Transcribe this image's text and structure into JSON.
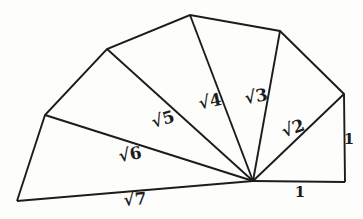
{
  "figure": {
    "name": "spiral-of-theodorus",
    "background_color": "#fdfdfb",
    "line_color": "#1c1c1c",
    "line_width": 1.9,
    "center_vertex": [
      253,
      181
    ],
    "outer_vertices": [
      [
        345,
        182
      ],
      [
        344,
        94
      ],
      [
        280,
        31
      ],
      [
        190,
        15
      ],
      [
        107,
        49
      ],
      [
        45,
        115
      ],
      [
        17,
        201
      ]
    ],
    "labels": [
      {
        "name": "hypotenuse-sqrt2-label",
        "text": "√2",
        "x": 293,
        "y": 128,
        "rotate": -20,
        "size": 17
      },
      {
        "name": "hypotenuse-sqrt3-label",
        "text": "√3",
        "x": 256,
        "y": 96,
        "rotate": -10,
        "size": 17
      },
      {
        "name": "hypotenuse-sqrt4-label",
        "text": "√4",
        "x": 210,
        "y": 101,
        "rotate": -12,
        "size": 17
      },
      {
        "name": "hypotenuse-sqrt5-label",
        "text": "√5",
        "x": 163,
        "y": 119,
        "rotate": -16,
        "size": 17
      },
      {
        "name": "hypotenuse-sqrt6-label",
        "text": "√6",
        "x": 130,
        "y": 154,
        "rotate": -10,
        "size": 17
      },
      {
        "name": "hypotenuse-sqrt7-label",
        "text": "√7",
        "x": 135,
        "y": 199,
        "rotate": -5,
        "size": 17
      },
      {
        "name": "unit-side-right-label",
        "text": "1",
        "x": 349,
        "y": 139,
        "rotate": 0,
        "size": 15
      },
      {
        "name": "unit-side-bottom-label",
        "text": "1",
        "x": 300,
        "y": 192,
        "rotate": 0,
        "size": 15
      }
    ]
  }
}
